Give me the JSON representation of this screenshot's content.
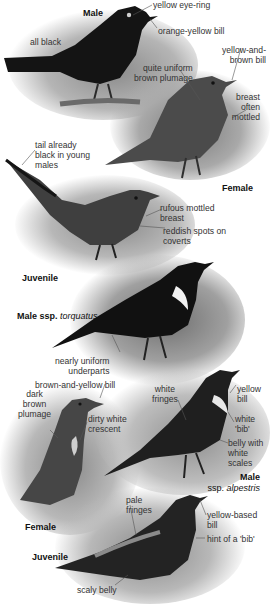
{
  "plate": {
    "species_figures": [
      {
        "id": "male",
        "caption": "Male",
        "labels": [
          "yellow eye-ring",
          "orange-yellow bill",
          "all black"
        ]
      },
      {
        "id": "female",
        "caption": "Female",
        "labels": [
          "yellow-and-brown bill",
          "quite uniform brown plumage",
          "breast often mottled"
        ]
      },
      {
        "id": "juvenile_blackbird",
        "caption": "Juvenile",
        "labels": [
          "tail already black in young males",
          "rufous mottled breast",
          "reddish spots on coverts"
        ]
      },
      {
        "id": "male_torquatus",
        "caption": "Male ssp.",
        "caption_italic": "torquatus",
        "labels": [
          "nearly uniform underparts"
        ]
      },
      {
        "id": "female_ring_ouzel",
        "caption": "Female",
        "labels": [
          "brown-and-yellow bill",
          "dark brown plumage",
          "dirty white crescent"
        ]
      },
      {
        "id": "male_alpestris",
        "caption": "Male",
        "caption_sub": "ssp.",
        "caption_italic": "alpestris",
        "labels": [
          "white fringes",
          "yellow bill",
          "white 'bib'",
          "belly with white scales"
        ]
      },
      {
        "id": "juvenile_ring_ouzel",
        "caption": "Juvenile",
        "labels": [
          "pale fringes",
          "yellow-based bill",
          "hint of a 'bib'",
          "scaly belly"
        ]
      }
    ]
  },
  "text": {
    "male": {
      "caption": "Male",
      "eye_ring": "yellow eye-ring",
      "bill": "orange-yellow bill",
      "all_black": "all black"
    },
    "female": {
      "caption": "Female",
      "bill_1": "yellow-and-",
      "bill_2": "brown bill",
      "plumage_1": "quite uniform",
      "plumage_2": "brown plumage",
      "breast_1": "breast",
      "breast_2": "often",
      "breast_3": "mottled"
    },
    "juvenile1": {
      "caption": "Juvenile",
      "tail_1": "tail already",
      "tail_2": "black in young",
      "tail_3": "males",
      "breast_1": "rufous mottled",
      "breast_2": "breast",
      "coverts_1": "reddish spots on",
      "coverts_2": "coverts"
    },
    "torquatus": {
      "caption": "Male ssp. ",
      "caption_italic": "torquatus",
      "underparts_1": "nearly uniform",
      "underparts_2": "underparts"
    },
    "female2": {
      "caption": "Female",
      "bill": "brown-and-yellow bill",
      "plumage_1": "dark",
      "plumage_2": "brown",
      "plumage_3": "plumage",
      "crescent_1": "dirty white",
      "crescent_2": "crescent"
    },
    "alpestris": {
      "caption_1": "Male",
      "caption_2": "ssp. ",
      "caption_italic": "alpestris",
      "fringes_1": "white",
      "fringes_2": "fringes",
      "bill_1": "yellow",
      "bill_2": "bill",
      "bib_1": "white",
      "bib_2": "'bib'",
      "belly_1": "belly with",
      "belly_2": "white",
      "belly_3": "scales"
    },
    "juvenile2": {
      "caption": "Juvenile",
      "fringes_1": "pale",
      "fringes_2": "fringes",
      "bill_1": "yellow-based",
      "bill_2": "bill",
      "bib": "hint of a 'bib'",
      "belly": "scaly belly"
    }
  },
  "colors": {
    "background": "#ffffff",
    "label_text": "#333333",
    "caption_text": "#111111",
    "leader_line": "#555555",
    "black_bird": "#151515",
    "brown_bird": "#4a4a4a",
    "vignette": "#9a9a9a"
  }
}
